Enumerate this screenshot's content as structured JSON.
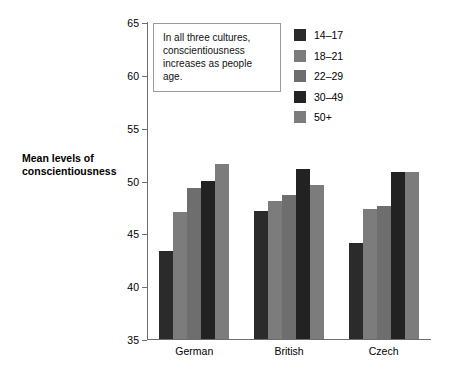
{
  "chart_data": {
    "type": "bar",
    "title": "",
    "xlabel": "",
    "ylabel": "Mean levels of conscientiousness",
    "ylim": [
      35,
      65
    ],
    "yticks": [
      35,
      40,
      45,
      50,
      55,
      60,
      65
    ],
    "grid": false,
    "legend_position": "top-right",
    "categories": [
      "German",
      "British",
      "Czech"
    ],
    "series": [
      {
        "name": "14–17",
        "color": "#2b2b2b",
        "values": [
          43.3,
          47.1,
          44.1
        ]
      },
      {
        "name": "18–21",
        "color": "#7c7c7c",
        "values": [
          47.0,
          48.1,
          47.3
        ]
      },
      {
        "name": "22–29",
        "color": "#6e6e6e",
        "values": [
          49.3,
          48.6,
          47.6
        ]
      },
      {
        "name": "30–49",
        "color": "#222222",
        "values": [
          50.0,
          51.1,
          50.8
        ]
      },
      {
        "name": "50+",
        "color": "#7c7c7c",
        "values": [
          51.6,
          49.6,
          50.8
        ]
      }
    ],
    "annotations": [
      {
        "text": "In all three cultures, conscientiousness increases as people age."
      }
    ]
  },
  "axis": {
    "y_title": "Mean levels of conscientiousness",
    "tick_labels": [
      "65",
      "60",
      "55",
      "50",
      "45",
      "40",
      "35"
    ]
  },
  "callout": {
    "line1": "In all three cultures,",
    "line2": "conscientiousness",
    "line3": "increases as people age."
  },
  "legend": {
    "items": [
      {
        "label": "14–17"
      },
      {
        "label": "18–21"
      },
      {
        "label": "22–29"
      },
      {
        "label": "30–49"
      },
      {
        "label": "50+"
      }
    ]
  },
  "colors": {
    "axis": "#6d6d6d",
    "text": "#000000",
    "background": "#ffffff",
    "callout_border": "#9a9a9a"
  }
}
